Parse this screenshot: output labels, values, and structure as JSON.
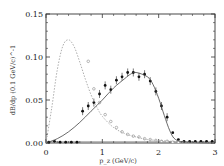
{
  "chart_data": {
    "type": "scatter",
    "title": "",
    "xlabel": "p_z (GeV/c)",
    "ylabel": "dB/dp (0.1 GeV/c)^-1",
    "xlim": [
      0,
      3
    ],
    "ylim": [
      0,
      0.15
    ],
    "x_ticks": [
      "0",
      "1",
      "2",
      "3"
    ],
    "y_ticks": [
      "0.00",
      "0.05",
      "0.10",
      "0.15"
    ],
    "grid": false,
    "series": [
      {
        "name": "data (filled)",
        "style": "filled-circle-with-errorbars",
        "x": [
          0.05,
          0.15,
          0.25,
          0.35,
          0.45,
          0.55,
          0.65,
          0.75,
          0.85,
          0.95,
          1.05,
          1.15,
          1.25,
          1.35,
          1.45,
          1.55,
          1.65,
          1.75,
          1.85,
          1.95,
          2.05,
          2.15,
          2.25,
          2.35,
          2.45,
          2.55,
          2.65,
          2.75,
          2.85,
          2.95
        ],
        "y": [
          0.001,
          0.002,
          0.001,
          0.001,
          0.001,
          0.001,
          0.037,
          0.043,
          0.047,
          0.057,
          0.067,
          0.062,
          0.073,
          0.077,
          0.082,
          0.082,
          0.077,
          0.08,
          0.072,
          0.06,
          0.043,
          0.03,
          0.012,
          0.004,
          0.002,
          0.002,
          0.002,
          0.002,
          0.002,
          0.002
        ]
      },
      {
        "name": "data (open)",
        "style": "open-circle",
        "x": [
          0.75,
          0.85,
          0.95,
          1.05,
          1.15,
          1.25,
          1.35,
          1.45,
          1.55,
          1.65,
          1.75,
          1.85,
          1.95,
          2.05,
          2.15,
          2.25,
          2.35
        ],
        "y": [
          0.095,
          0.063,
          0.047,
          0.033,
          0.025,
          0.018,
          0.013,
          0.01,
          0.008,
          0.007,
          0.005,
          0.004,
          0.003,
          0.002,
          0.002,
          0.001,
          0.001
        ]
      },
      {
        "name": "model (solid)",
        "style": "solid-line",
        "x": [
          0,
          0.2,
          0.4,
          0.6,
          0.8,
          1.0,
          1.2,
          1.4,
          1.5,
          1.6,
          1.8,
          1.9,
          2.0,
          2.1,
          2.2,
          2.3,
          2.5,
          3.0
        ],
        "y": [
          0,
          0.005,
          0.013,
          0.024,
          0.037,
          0.05,
          0.064,
          0.075,
          0.08,
          0.082,
          0.077,
          0.068,
          0.052,
          0.032,
          0.014,
          0.004,
          0.001,
          0
        ]
      },
      {
        "name": "model (dashed)",
        "style": "dashed-line",
        "x": [
          0,
          0.1,
          0.2,
          0.3,
          0.4,
          0.5,
          0.6,
          0.7,
          0.8,
          0.9,
          1.0,
          1.2,
          1.4,
          1.6,
          1.8,
          2.0,
          2.5,
          3.0
        ],
        "y": [
          0,
          0.04,
          0.085,
          0.113,
          0.12,
          0.112,
          0.094,
          0.074,
          0.056,
          0.042,
          0.031,
          0.018,
          0.011,
          0.007,
          0.004,
          0.003,
          0.001,
          0
        ]
      }
    ]
  }
}
